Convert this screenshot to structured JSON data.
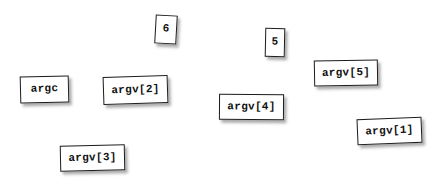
{
  "scene": {
    "background_color": "#ffffff",
    "width": 446,
    "height": 181,
    "title": "argc and argv cards"
  },
  "style": {
    "card_background": "#ffffff",
    "card_border_color": "#1c1c1c",
    "card_text_color": "#111111",
    "shadow_color": "rgba(70,70,70,0.45)"
  },
  "cards": [
    {
      "id": "argc",
      "label": "argc",
      "kind": "variable"
    },
    {
      "id": "argv2",
      "label": "argv[2]",
      "kind": "variable"
    },
    {
      "id": "six",
      "label": "6",
      "kind": "value"
    },
    {
      "id": "five",
      "label": "5",
      "kind": "value"
    },
    {
      "id": "argv5",
      "label": "argv[5]",
      "kind": "variable"
    },
    {
      "id": "argv4",
      "label": "argv[4]",
      "kind": "variable"
    },
    {
      "id": "argv1",
      "label": "argv[1]",
      "kind": "variable"
    },
    {
      "id": "argv3",
      "label": "argv[3]",
      "kind": "variable"
    }
  ]
}
